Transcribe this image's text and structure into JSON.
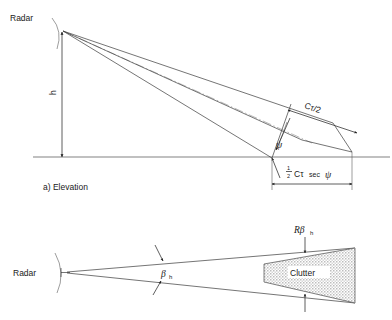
{
  "figure": {
    "background_color": "#ffffff",
    "line_color": "#3a3a3a",
    "clutter_fill_color": "#d4d4d4"
  },
  "elevation": {
    "caption": "a) Elevation",
    "radar_label": "Radar",
    "height_label": "h",
    "range_cell_label": "Cτ/2",
    "grazing_angle_label": "ψ",
    "ground_extent_numerator": "1",
    "ground_extent_denominator": "2",
    "ground_extent_body": "Cτ",
    "ground_extent_sec": "sec",
    "ground_extent_angle": "ψ"
  },
  "plan": {
    "radar_label": "Radar",
    "beamwidth_label": "β",
    "beamwidth_subscript": "h",
    "cross_range_label": "Rβ",
    "cross_range_subscript": "h",
    "clutter_label": "Clutter"
  }
}
